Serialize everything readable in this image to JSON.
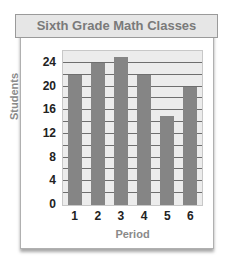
{
  "chart_data": {
    "type": "bar",
    "title": "Sixth Grade Math Classes",
    "xlabel": "Period",
    "ylabel": "Students",
    "categories": [
      "1",
      "2",
      "3",
      "4",
      "5",
      "6"
    ],
    "values": [
      22,
      24,
      25,
      22,
      15,
      20
    ],
    "yticks": [
      0,
      4,
      8,
      12,
      16,
      20,
      24
    ],
    "ylim": [
      0,
      26
    ],
    "grid_step": 2,
    "grid": true,
    "legend": null,
    "colors": {
      "bar": "#858585",
      "plot_bg": "#ececec",
      "gridline": "#6e6e6e",
      "title_bg": "#e6e6e6",
      "title_text": "#7a7a7a"
    }
  }
}
